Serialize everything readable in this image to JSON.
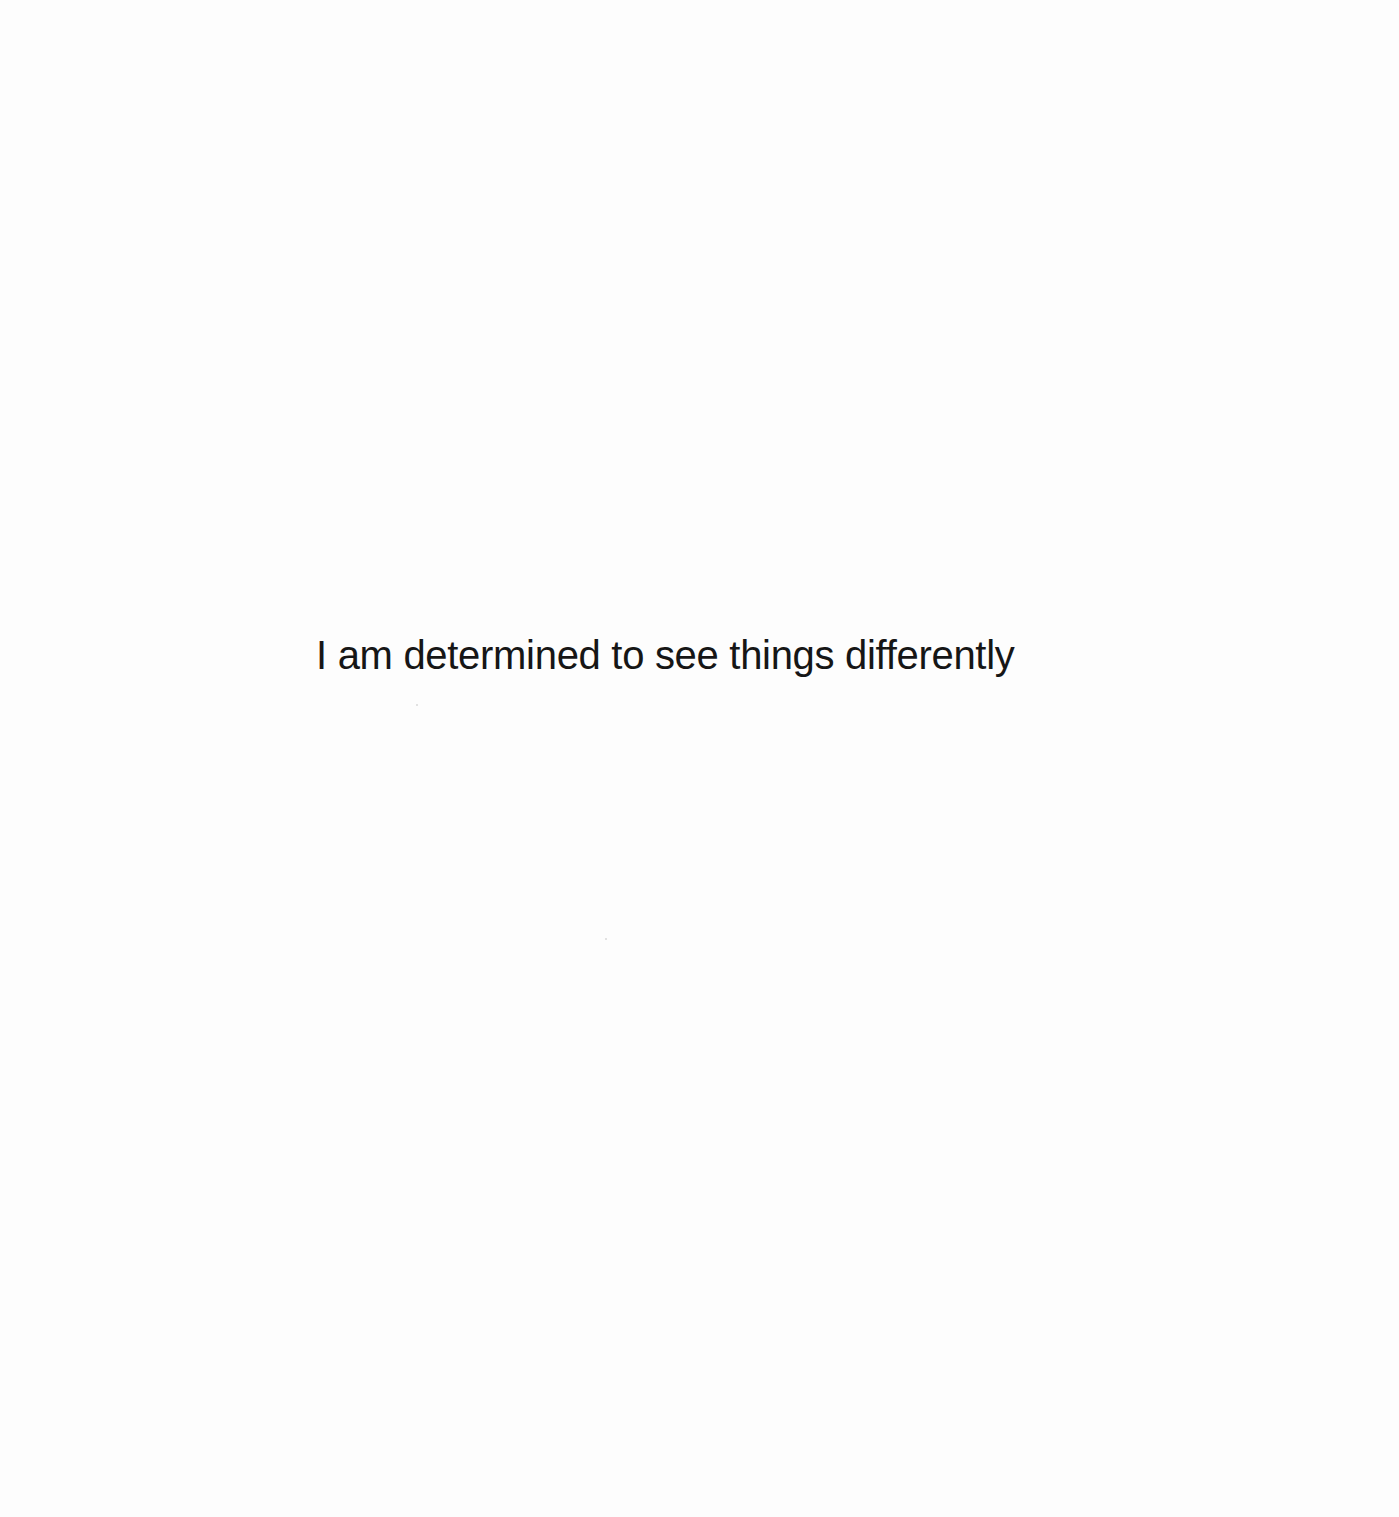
{
  "page": {
    "statement": "I am determined to see things differently",
    "colors": {
      "background": "#fdfdfd",
      "text": "#161616"
    }
  }
}
